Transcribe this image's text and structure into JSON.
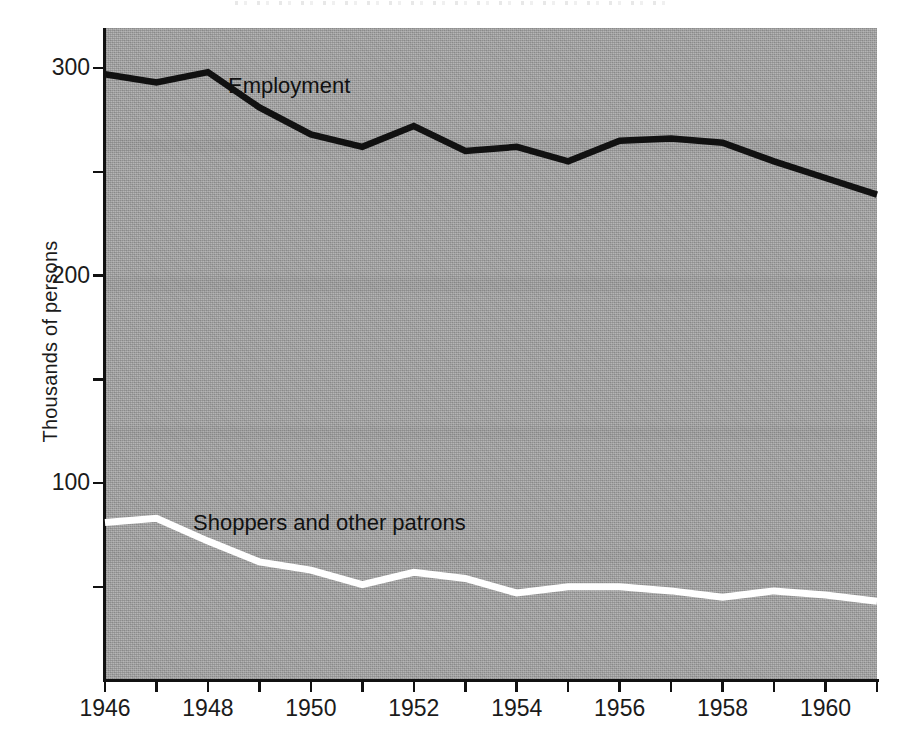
{
  "chart_data": {
    "type": "line",
    "title": "",
    "subtitle": "",
    "xlabel": "",
    "ylabel": "Thousands of persons",
    "x": [
      1946,
      1947,
      1948,
      1949,
      1950,
      1951,
      1952,
      1953,
      1954,
      1955,
      1956,
      1957,
      1958,
      1959,
      1960,
      1961
    ],
    "xlim": [
      1946,
      1961
    ],
    "ylim": [
      0,
      315
    ],
    "grid": false,
    "legend_position": "inline-annotation",
    "x_tick_labels": [
      "1946",
      "",
      "1948",
      "",
      "1950",
      "",
      "1952",
      "",
      "1954",
      "",
      "1956",
      "",
      "1958",
      "",
      "1960",
      ""
    ],
    "y_ticks": [
      50,
      100,
      150,
      200,
      250,
      300
    ],
    "y_tick_labels": [
      "",
      "100",
      "",
      "200",
      "",
      "300"
    ],
    "series": [
      {
        "name": "Employment",
        "color": "#111111",
        "label_text": "Employment",
        "values": [
          297,
          293,
          298,
          281,
          268,
          262,
          272,
          260,
          262,
          255,
          265,
          266,
          264,
          255,
          247,
          239
        ]
      },
      {
        "name": "Shoppers and other patrons",
        "color": "#ffffff",
        "label_text": "Shoppers and other patrons",
        "values": [
          81,
          83,
          72,
          62,
          58,
          51,
          57,
          54,
          47,
          50,
          50,
          48,
          45,
          48,
          46,
          43
        ]
      }
    ]
  },
  "axes": {
    "y_title": "Thousands of persons"
  },
  "annotations": {
    "employment": "Employment",
    "shoppers": "Shoppers and other patrons"
  },
  "colors": {
    "plot_background": "#a3a3a3",
    "page_background": "#ffffff",
    "axis": "#111111",
    "employment_line": "#111111",
    "shoppers_line": "#ffffff",
    "text": "#1b1b1b"
  }
}
